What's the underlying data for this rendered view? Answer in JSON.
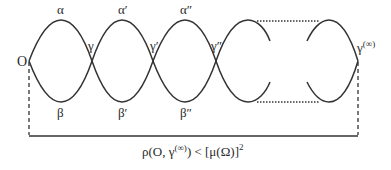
{
  "diagram": {
    "labels": {
      "origin": "O",
      "top": [
        "α",
        "α′",
        "α″"
      ],
      "bottom": [
        "β",
        "β′",
        "β″"
      ],
      "crossings": [
        "γ",
        "γ′",
        "γ″"
      ],
      "end": "γ",
      "end_sup": "(∞)"
    },
    "formula": {
      "lhs": "ρ(O, γ",
      "sup": "(∞)",
      "rhs": ") < [μ(Ω)]",
      "exp": "2"
    },
    "colors": {
      "stroke": "#333333",
      "background": "#ffffff"
    }
  }
}
